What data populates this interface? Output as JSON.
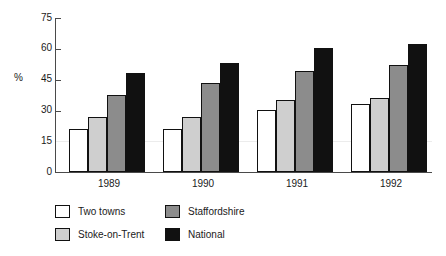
{
  "chart_data": {
    "type": "bar",
    "title": "",
    "xlabel": "",
    "ylabel": "%",
    "ylim": [
      0,
      75
    ],
    "yticks": [
      0,
      15,
      30,
      45,
      60,
      75
    ],
    "ytick_labels": [
      "0",
      "15",
      "30",
      "45",
      "60",
      "75"
    ],
    "grid": false,
    "legend_position": "bottom-left",
    "categories": [
      "1989",
      "1990",
      "1991",
      "1992"
    ],
    "series": [
      {
        "name": "Two towns",
        "color": "#ffffff",
        "values": [
          21,
          21,
          30,
          33
        ]
      },
      {
        "name": "Stoke-on-Trent",
        "color": "#cfcfcf",
        "values": [
          27,
          27,
          35,
          36
        ]
      },
      {
        "name": "Staffordshire",
        "color": "#8c8c8c",
        "values": [
          37.5,
          43.5,
          49,
          52
        ]
      },
      {
        "name": "National",
        "color": "#111111",
        "values": [
          48,
          53,
          60.5,
          62.5
        ]
      }
    ]
  },
  "axis": {
    "ylabel": "%",
    "ticks": [
      "75",
      "60",
      "45",
      "30",
      "15",
      "0"
    ]
  },
  "xaxis": {
    "labels": [
      "1989",
      "1990",
      "1991",
      "1992"
    ]
  },
  "legend": {
    "items": [
      {
        "label": "Two towns",
        "swatch": "white-swatch"
      },
      {
        "label": "Stoke-on-Trent",
        "swatch": "light-gray-swatch"
      },
      {
        "label": "Staffordshire",
        "swatch": "mid-gray-swatch"
      },
      {
        "label": "National",
        "swatch": "black-swatch"
      }
    ]
  }
}
